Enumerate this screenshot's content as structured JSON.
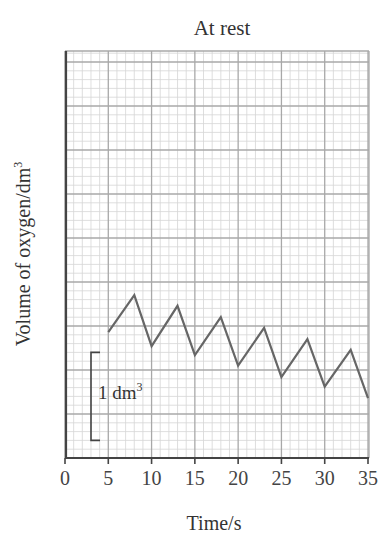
{
  "chart_data": {
    "type": "line",
    "title": "At rest",
    "xlabel": "Time/s",
    "ylabel": "Volume of oxygen/dm",
    "ylabel_superscript": "3",
    "xlim": [
      0,
      35
    ],
    "ylim_dm3": [
      0,
      4.6
    ],
    "x_ticks": [
      0,
      5,
      10,
      15,
      20,
      25,
      30,
      35
    ],
    "x_tick_labels": [
      "0",
      "5",
      "10",
      "15",
      "20",
      "25",
      "30",
      "35"
    ],
    "y_ticks": [],
    "grid": true,
    "grid_major_x_step": 5,
    "grid_minor_x_step": 1,
    "grid_major_y_step_dm3": 0.5,
    "grid_minor_y_step_dm3": 0.1,
    "legend": null,
    "scale_bar": {
      "label": "1 dm",
      "superscript": "3",
      "length_dm3": 1,
      "from_dm3": 0.2,
      "to_dm3": 1.2,
      "x_seconds": 3
    },
    "series": [
      {
        "name": "Volume of oxygen (spirometer trace, at rest)",
        "x": [
          5,
          8,
          10,
          13,
          15,
          18,
          20,
          23,
          25,
          28,
          30,
          33,
          35
        ],
        "y": [
          1.43,
          1.85,
          1.27,
          1.73,
          1.17,
          1.6,
          1.05,
          1.48,
          0.92,
          1.35,
          0.81,
          1.23,
          0.68
        ]
      }
    ],
    "colors": {
      "line": "#666666",
      "axis": "#444444",
      "grid_major": "#a8a8a8",
      "grid_minor": "#d6d6d6",
      "text": "#333333"
    }
  }
}
